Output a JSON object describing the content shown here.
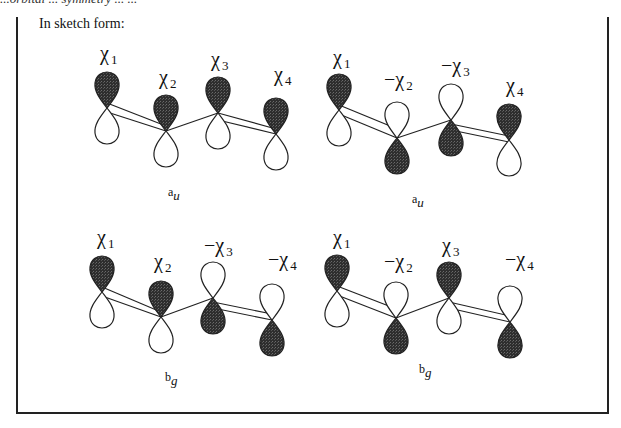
{
  "header": {
    "cut_off_text": "...orbital ... symmetry ... ...",
    "intro": "In sketch form:"
  },
  "colors": {
    "filled_lobe": "#2b2b2b",
    "line": "#222222",
    "background": "#ffffff"
  },
  "diagrams": [
    {
      "id": "top-left",
      "symmetry": {
        "main": "a",
        "sub": "u"
      },
      "labels": [
        "χ1",
        "χ2",
        "χ3",
        "χ4"
      ],
      "label_parts": [
        {
          "sign": "",
          "chi": "χ",
          "n": "1"
        },
        {
          "sign": "",
          "chi": "χ",
          "n": "2"
        },
        {
          "sign": "",
          "chi": "χ",
          "n": "3"
        },
        {
          "sign": "",
          "chi": "χ",
          "n": "4"
        }
      ],
      "orbitals_top_filled": [
        true,
        true,
        true,
        true
      ]
    },
    {
      "id": "top-right",
      "symmetry": {
        "main": "a",
        "sub": "u"
      },
      "labels": [
        "χ1",
        "−χ2",
        "−χ3",
        "χ4"
      ],
      "label_parts": [
        {
          "sign": "",
          "chi": "χ",
          "n": "1"
        },
        {
          "sign": "−",
          "chi": "χ",
          "n": "2"
        },
        {
          "sign": "−",
          "chi": "χ",
          "n": "3"
        },
        {
          "sign": "",
          "chi": "χ",
          "n": "4"
        }
      ],
      "orbitals_top_filled": [
        true,
        false,
        false,
        true
      ]
    },
    {
      "id": "bottom-left",
      "symmetry": {
        "main": "b",
        "sub": "g"
      },
      "labels": [
        "χ1",
        "χ2",
        "−χ3",
        "−χ4"
      ],
      "label_parts": [
        {
          "sign": "",
          "chi": "χ",
          "n": "1"
        },
        {
          "sign": "",
          "chi": "χ",
          "n": "2"
        },
        {
          "sign": "−",
          "chi": "χ",
          "n": "3"
        },
        {
          "sign": "−",
          "chi": "χ",
          "n": "4"
        }
      ],
      "orbitals_top_filled": [
        true,
        true,
        false,
        false
      ]
    },
    {
      "id": "bottom-right",
      "symmetry": {
        "main": "b",
        "sub": "g"
      },
      "labels": [
        "χ1",
        "−χ2",
        "χ3",
        "−χ4"
      ],
      "label_parts": [
        {
          "sign": "",
          "chi": "χ",
          "n": "1"
        },
        {
          "sign": "−",
          "chi": "χ",
          "n": "2"
        },
        {
          "sign": "",
          "chi": "χ",
          "n": "3"
        },
        {
          "sign": "−",
          "chi": "χ",
          "n": "4"
        }
      ],
      "orbitals_top_filled": [
        true,
        false,
        true,
        false
      ]
    }
  ]
}
